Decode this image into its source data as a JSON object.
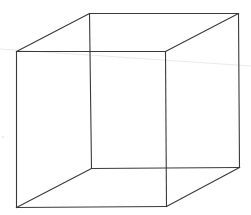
{
  "diagram": {
    "type": "wireframe-cube",
    "colors": {
      "background": "#ffffff",
      "edge": "#3a3a3a",
      "artifact_line": "#e4e4e4",
      "artifact_dot": "#d0d0d0"
    },
    "vertices": {
      "front_top_left": [
        16,
        51
      ],
      "front_top_right": [
        165,
        51
      ],
      "front_bottom_left": [
        16,
        207
      ],
      "front_bottom_right": [
        166,
        206
      ],
      "back_top_left": [
        89,
        13
      ],
      "back_top_right": [
        238,
        13
      ],
      "back_bottom_left": [
        91,
        168
      ],
      "back_bottom_right": [
        239,
        167
      ]
    },
    "edges": [
      {
        "name": "front-top-edge",
        "from": "front_top_left",
        "to": "front_top_right"
      },
      {
        "name": "front-bottom-edge",
        "from": "front_bottom_left",
        "to": "front_bottom_right"
      },
      {
        "name": "front-left-edge",
        "from": "front_top_left",
        "to": "front_bottom_left"
      },
      {
        "name": "front-right-edge",
        "from": "front_top_right",
        "to": "front_bottom_right"
      },
      {
        "name": "back-top-edge",
        "from": "back_top_left",
        "to": "back_top_right"
      },
      {
        "name": "back-bottom-edge",
        "from": "back_bottom_left",
        "to": "back_bottom_right"
      },
      {
        "name": "back-left-edge",
        "from": "back_top_left",
        "to": "back_bottom_left"
      },
      {
        "name": "back-right-edge",
        "from": "back_top_right",
        "to": "back_bottom_right"
      },
      {
        "name": "top-left-connector",
        "from": "front_top_left",
        "to": "back_top_left"
      },
      {
        "name": "top-right-connector",
        "from": "front_top_right",
        "to": "back_top_right"
      },
      {
        "name": "bottom-left-connector",
        "from": "front_bottom_left",
        "to": "back_bottom_left"
      },
      {
        "name": "bottom-right-connector",
        "from": "front_bottom_right",
        "to": "back_bottom_right"
      }
    ],
    "artifacts": {
      "faint_line": {
        "from": [
          0,
          49
        ],
        "to": [
          251,
          66
        ]
      },
      "speck": [
        3,
        137
      ]
    }
  }
}
